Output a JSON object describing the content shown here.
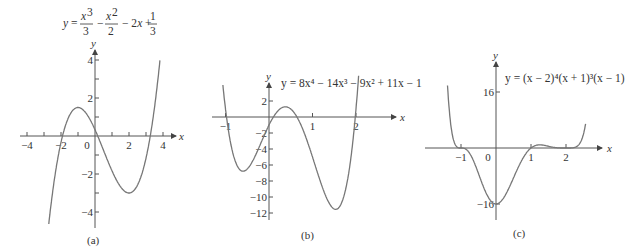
{
  "figure": {
    "panels": [
      {
        "id": "a",
        "caption": "(a)",
        "equation": {
          "prefix": "y = ",
          "parts": [
            "x³/3",
            "x²/2",
            "2x",
            "1/3"
          ]
        },
        "x_axis_label": "x",
        "y_axis_label": "y",
        "x_ticks": [
          -4,
          -3,
          -2,
          -1,
          0,
          1,
          2,
          3,
          4
        ],
        "x_tick_labels": [
          {
            "v": -4,
            "t": "−4"
          },
          {
            "v": -2,
            "t": "−2"
          },
          {
            "v": 0,
            "t": "0"
          },
          {
            "v": 2,
            "t": "2"
          },
          {
            "v": 4,
            "t": "4"
          }
        ],
        "y_ticks": [
          -4,
          -3,
          -2,
          -1,
          1,
          2,
          3,
          4
        ],
        "y_tick_labels": [
          {
            "v": 4,
            "t": "4"
          },
          {
            "v": 2,
            "t": "2"
          },
          {
            "v": -2,
            "t": "−2"
          },
          {
            "v": -4,
            "t": "−4"
          }
        ]
      },
      {
        "id": "b",
        "caption": "(b)",
        "equation_text": "y = 8x⁴ − 14x³ − 9x² + 11x − 1",
        "x_axis_label": "x",
        "y_axis_label": "y",
        "x_ticks": [
          -1,
          1,
          2
        ],
        "x_tick_labels": [
          {
            "v": -1,
            "t": "−1"
          },
          {
            "v": 1,
            "t": "1"
          },
          {
            "v": 2,
            "t": "2"
          }
        ],
        "y_ticks": [
          2,
          -2,
          -4,
          -6,
          -8,
          -10,
          -12
        ],
        "y_tick_labels": [
          {
            "v": 2,
            "t": "2"
          },
          {
            "v": -2,
            "t": "−2"
          },
          {
            "v": -4,
            "t": "−4"
          },
          {
            "v": -6,
            "t": "−6"
          },
          {
            "v": -8,
            "t": "−8"
          },
          {
            "v": -10,
            "t": "−10"
          },
          {
            "v": -12,
            "t": "−12"
          }
        ]
      },
      {
        "id": "c",
        "caption": "(c)",
        "equation_text": "y = (x − 2)⁴(x + 1)³(x − 1)",
        "x_axis_label": "x",
        "y_axis_label": "y",
        "x_ticks": [
          -1,
          1,
          2
        ],
        "x_tick_labels": [
          {
            "v": -1,
            "t": "−1"
          },
          {
            "v": 0,
            "t": "0"
          },
          {
            "v": 1,
            "t": "1"
          },
          {
            "v": 2,
            "t": "2"
          }
        ],
        "y_ticks": [
          16,
          -16
        ],
        "y_tick_labels": [
          {
            "v": 16,
            "t": "16"
          },
          {
            "v": -16,
            "t": "−16"
          }
        ]
      }
    ]
  },
  "chart_data": [
    {
      "type": "line",
      "title": "y = x³/3 − x²/2 − 2x + 1/3",
      "xlabel": "x",
      "ylabel": "y",
      "xlim": [
        -4.3,
        4.4
      ],
      "ylim": [
        -4.6,
        4.6
      ],
      "x": [
        -2.7,
        -2,
        -1,
        0,
        1,
        2,
        3,
        3.8
      ],
      "values": [
        -4.45,
        -0.33,
        1.5,
        0.33,
        -1.83,
        -3.0,
        -1.17,
        4.7
      ],
      "grid": false
    },
    {
      "type": "line",
      "title": "y = 8x⁴ − 14x³ − 9x² + 11x − 1",
      "xlabel": "x",
      "ylabel": "y",
      "xlim": [
        -1.3,
        2.9
      ],
      "ylim": [
        -13,
        4
      ],
      "x": [
        -1.05,
        -1,
        -0.5,
        0,
        0.3,
        1,
        1.5,
        2,
        2.05
      ],
      "values": [
        4.3,
        1,
        -6.5,
        -1,
        1.5,
        -5,
        -11.5,
        1,
        4.6
      ],
      "grid": false
    },
    {
      "type": "line",
      "title": "y = (x − 2)⁴(x + 1)³(x − 1)",
      "xlabel": "x",
      "ylabel": "y",
      "xlim": [
        -1.6,
        3.0
      ],
      "ylim": [
        -20,
        24
      ],
      "x": [
        -1.38,
        -1,
        -0.5,
        0,
        0.5,
        1,
        1.4,
        2,
        2.55
      ],
      "values": [
        20,
        0,
        -1.9,
        -16,
        -10.3,
        0,
        0.6,
        0,
        18
      ],
      "grid": false
    }
  ]
}
